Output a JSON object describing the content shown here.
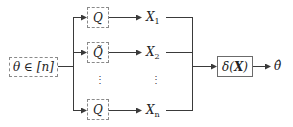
{
  "diagram": {
    "input": {
      "label": "θ ∈ [n]"
    },
    "channels": [
      {
        "label": "Q",
        "output": "X",
        "subscript": "1"
      },
      {
        "label": "Q̃",
        "output": "X",
        "subscript": "2"
      },
      {
        "label": "Q",
        "output": "X",
        "subscript": "n"
      }
    ],
    "ellipsis": "⋮",
    "estimator": {
      "label_pre": "δ(",
      "label_bold": "X",
      "label_post": ")"
    },
    "output": {
      "label": "θ̂"
    },
    "colors": {
      "line": "#3a3a3a",
      "dashed_border": "#8a8a8a",
      "solid_border": "#6b6b6b"
    }
  }
}
